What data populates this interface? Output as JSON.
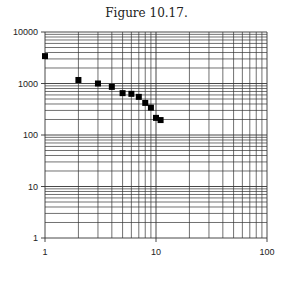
{
  "figure": {
    "title": "Figure 10.17."
  },
  "chart_data": {
    "type": "scatter",
    "title": "Figure 10.17.",
    "xlabel": "",
    "ylabel": "",
    "xscale": "log",
    "yscale": "log",
    "xlim": [
      1,
      100
    ],
    "ylim": [
      1,
      10000
    ],
    "grid": true,
    "x_ticks": [
      "1",
      "10",
      "100"
    ],
    "y_ticks": [
      "1",
      "10",
      "100",
      "1000",
      "10000"
    ],
    "series": [
      {
        "name": "data",
        "marker": "square",
        "color": "#000000",
        "x": [
          1,
          2,
          3,
          4,
          5,
          6,
          7,
          8,
          9,
          10,
          11
        ],
        "y": [
          3400,
          1170,
          1000,
          860,
          650,
          630,
          550,
          420,
          340,
          215,
          195
        ]
      }
    ]
  }
}
